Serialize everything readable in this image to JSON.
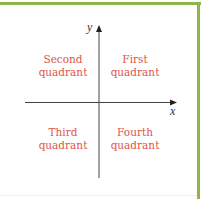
{
  "diagram": {
    "type": "cartesian-plane-quadrants",
    "axes": {
      "x_label": "x",
      "y_label": "y"
    },
    "quadrants": {
      "second": {
        "line1": "Second",
        "line2": "quadrant"
      },
      "first": {
        "line1": "First",
        "line2": "quadrant"
      },
      "third": {
        "line1": "Third",
        "line2": "quadrant"
      },
      "fourth": {
        "line1": "Fourth",
        "line2": "quadrant"
      }
    },
    "colors": {
      "border": "#8db54a",
      "label": "#e0554a",
      "axis": "#333333"
    }
  }
}
